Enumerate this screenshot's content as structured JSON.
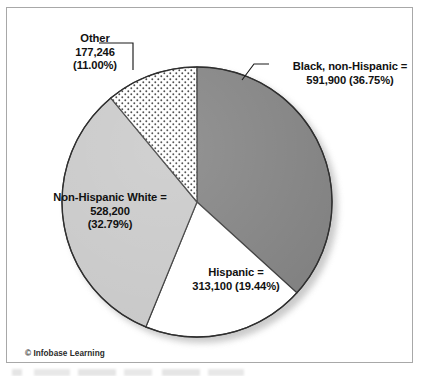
{
  "figure": {
    "credit": "© Infobase Learning",
    "frame_color": "#a8a8a8"
  },
  "chart_data": {
    "type": "pie",
    "title": "",
    "subtitle": "",
    "xlabel": "",
    "ylabel": "",
    "legend_position": "callout-labels",
    "grid": false,
    "total": 1610446,
    "start_angle_deg": 0,
    "direction": "clockwise",
    "categories": [
      "Black, non-Hispanic",
      "Hispanic",
      "Non-Hispanic White",
      "Other"
    ],
    "values": [
      591900,
      313100,
      528200,
      177246
    ],
    "percents": [
      36.75,
      19.44,
      32.79,
      11.0
    ],
    "slices": [
      {
        "name": "Black, non-Hispanic",
        "value": 591900,
        "value_text": "591,900",
        "percent": 36.75,
        "percent_text": "(36.75%)",
        "label_lines": [
          "Black, non-Hispanic =",
          "591,900 (36.75%)"
        ],
        "fill": "#808080",
        "pattern": "solid"
      },
      {
        "name": "Hispanic",
        "value": 313100,
        "value_text": "313,100",
        "percent": 19.44,
        "percent_text": "(19.44%)",
        "label_lines": [
          "Hispanic =",
          "313,100 (19.44%)"
        ],
        "fill": "#ffffff",
        "pattern": "solid"
      },
      {
        "name": "Non-Hispanic White",
        "value": 528200,
        "value_text": "528,200",
        "percent": 32.79,
        "percent_text": "(32.79%)",
        "label_lines": [
          "Non-Hispanic White =",
          "528,200",
          "(32.79%)"
        ],
        "fill": "#c8c8c8",
        "pattern": "solid"
      },
      {
        "name": "Other",
        "value": 177246,
        "value_text": "177,246",
        "percent": 11.0,
        "percent_text": "(11.00%)",
        "label_lines": [
          "Other",
          "177,246",
          "(11.00%)"
        ],
        "fill": "#ffffff",
        "pattern": "dotted-stipple"
      }
    ]
  }
}
